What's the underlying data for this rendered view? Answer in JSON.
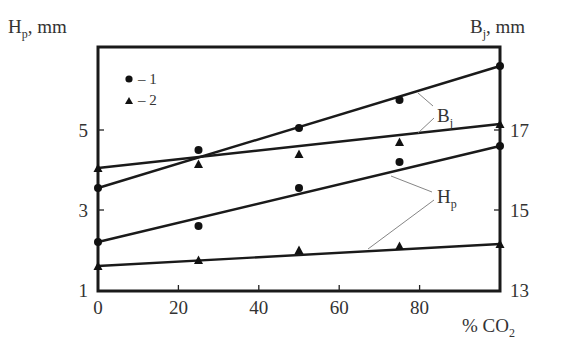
{
  "chart_data": {
    "type": "scatter",
    "title": "",
    "xlabel": "% CO2",
    "ylabel_left": "Hp, mm",
    "ylabel_right": "Bj, mm",
    "x_ticks": [
      0,
      20,
      40,
      60,
      80
    ],
    "y_left_ticks": [
      1,
      3,
      5
    ],
    "y_right_ticks": [
      13,
      15,
      17
    ],
    "xlim": [
      0,
      100
    ],
    "ylim_left": [
      1,
      7.1
    ],
    "ylim_right": [
      13,
      19.1
    ],
    "grid": false,
    "legend": [
      {
        "marker": "circle",
        "label": "– 1"
      },
      {
        "marker": "triangle",
        "label": "– 2"
      }
    ],
    "annotations": [
      "Bj",
      "Hp"
    ],
    "series": [
      {
        "name": "Bj – 1",
        "axis": "right",
        "marker": "circle",
        "x": [
          0,
          25,
          50,
          75,
          100
        ],
        "values": [
          15.55,
          16.5,
          17.05,
          17.75,
          18.6
        ],
        "fit": {
          "x0": 0,
          "y0": 15.55,
          "x1": 100,
          "y1": 18.6
        }
      },
      {
        "name": "Bj – 2",
        "axis": "right",
        "marker": "triangle",
        "x": [
          0,
          25,
          50,
          75,
          100
        ],
        "values": [
          16.05,
          16.15,
          16.4,
          16.7,
          17.15
        ],
        "fit": {
          "x0": 0,
          "y0": 16.05,
          "x1": 100,
          "y1": 17.15
        }
      },
      {
        "name": "Hp – 1",
        "axis": "left",
        "marker": "circle",
        "x": [
          0,
          25,
          50,
          75,
          100
        ],
        "values": [
          2.2,
          2.6,
          3.55,
          4.2,
          4.6
        ],
        "fit": {
          "x0": 0,
          "y0": 2.2,
          "x1": 100,
          "y1": 4.6
        }
      },
      {
        "name": "Hp – 2",
        "axis": "left",
        "marker": "triangle",
        "x": [
          0,
          25,
          50,
          75,
          100
        ],
        "values": [
          1.6,
          1.75,
          2.0,
          2.1,
          2.15
        ],
        "fit": {
          "x0": 0,
          "y0": 1.6,
          "x1": 100,
          "y1": 2.15
        }
      }
    ]
  },
  "labels": {
    "y_left_main": "H",
    "y_left_sub": "p",
    "y_left_unit": ", mm",
    "y_right_main": "B",
    "y_right_sub": "j",
    "y_right_unit": ", mm",
    "x_main": "% CO",
    "x_sub": "2",
    "legend_1": "– 1",
    "legend_2": "– 2",
    "ann_b_main": "B",
    "ann_b_sub": "j",
    "ann_h_main": "H",
    "ann_h_sub": "p"
  }
}
